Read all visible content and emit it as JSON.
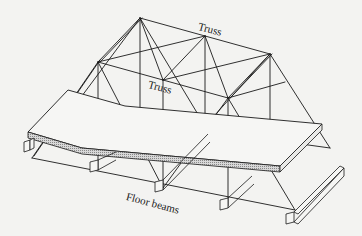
{
  "figure": {
    "type": "isometric structural diagram",
    "line_color": "#1a1a1a",
    "background": "#f3f3f1",
    "deck_hatch_color": "#9a9a9a"
  },
  "labels": {
    "truss_top": "Truss",
    "truss_middle": "Truss",
    "floor_beams": "Floor beams"
  }
}
